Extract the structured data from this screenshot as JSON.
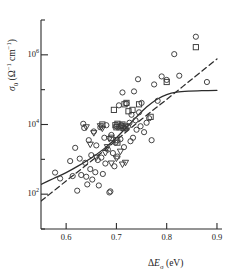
{
  "chart_data": {
    "type": "scatter",
    "title": "",
    "xlabel": "ΔEσ (eV)",
    "ylabel": "σ0 (Ω−1 cm−1)",
    "xlabel_parts": {
      "delta": "Δ",
      "e": "E",
      "sub": "σ",
      "unit": "(eV)"
    },
    "ylabel_parts": {
      "sigma": "σ",
      "sub": "0",
      "open": "(",
      "omega": "Ω",
      "exp1": "−1",
      "cm": "cm",
      "exp2": "−1",
      "close": ")"
    },
    "xlim": [
      0.55,
      0.91
    ],
    "ylim_log10": [
      1.0,
      7.0
    ],
    "xticks": [
      0.6,
      0.7,
      0.8,
      0.9
    ],
    "xticklabels": [
      "0.6",
      "0.7",
      "0.8",
      "0.9"
    ],
    "yticks_log10": [
      2,
      4,
      6
    ],
    "yticklabels": [
      "10²",
      "10⁴",
      "10⁶"
    ],
    "ytick_bases": [
      "10",
      "10",
      "10"
    ],
    "ytick_exps": [
      "2",
      "4",
      "6"
    ],
    "yminor_log10": [
      1,
      3,
      5,
      7
    ],
    "grid": false,
    "legend": "none",
    "axis_style": "left-and-bottom-spines",
    "series": [
      {
        "name": "circles",
        "marker": "circle",
        "points": [
          [
            0.578,
            2.62
          ],
          [
            0.588,
            2.45
          ],
          [
            0.608,
            2.95
          ],
          [
            0.613,
            2.52
          ],
          [
            0.618,
            3.33
          ],
          [
            0.622,
            2.1
          ],
          [
            0.627,
            3.02
          ],
          [
            0.63,
            2.55
          ],
          [
            0.634,
            4.02
          ],
          [
            0.636,
            3.9
          ],
          [
            0.638,
            2.9
          ],
          [
            0.64,
            2.5
          ],
          [
            0.642,
            2.28
          ],
          [
            0.645,
            3.55
          ],
          [
            0.648,
            2.72
          ],
          [
            0.65,
            3.12
          ],
          [
            0.652,
            2.42
          ],
          [
            0.655,
            3.8
          ],
          [
            0.658,
            2.63
          ],
          [
            0.66,
            3.4
          ],
          [
            0.663,
            2.98
          ],
          [
            0.665,
            2.25
          ],
          [
            0.668,
            3.92
          ],
          [
            0.67,
            3.05
          ],
          [
            0.673,
            2.58
          ],
          [
            0.676,
            3.62
          ],
          [
            0.678,
            2.88
          ],
          [
            0.68,
            3.98
          ],
          [
            0.683,
            3.28
          ],
          [
            0.686,
            2.05
          ],
          [
            0.688,
            2.08
          ],
          [
            0.69,
            3.7
          ],
          [
            0.693,
            3.18
          ],
          [
            0.696,
            2.8
          ],
          [
            0.698,
            3.48
          ],
          [
            0.7,
            3.95
          ],
          [
            0.702,
            3.08
          ],
          [
            0.705,
            4.55
          ],
          [
            0.708,
            3.58
          ],
          [
            0.71,
            3.98
          ],
          [
            0.712,
            4.92
          ],
          [
            0.715,
            3.35
          ],
          [
            0.718,
            3.88
          ],
          [
            0.72,
            4.6
          ],
          [
            0.723,
            3.95
          ],
          [
            0.726,
            4.05
          ],
          [
            0.728,
            3.52
          ],
          [
            0.73,
            4.28
          ],
          [
            0.733,
            3.62
          ],
          [
            0.735,
            4.95
          ],
          [
            0.738,
            4.12
          ],
          [
            0.74,
            3.85
          ],
          [
            0.743,
            5.3
          ],
          [
            0.745,
            4.35
          ],
          [
            0.748,
            3.95
          ],
          [
            0.75,
            4.62
          ],
          [
            0.755,
            3.78
          ],
          [
            0.76,
            4.05
          ],
          [
            0.765,
            4.18
          ],
          [
            0.77,
            3.55
          ],
          [
            0.775,
            5.15
          ],
          [
            0.782,
            4.68
          ],
          [
            0.79,
            5.38
          ],
          [
            0.8,
            5.28
          ],
          [
            0.815,
            6.02
          ],
          [
            0.825,
            5.4
          ],
          [
            0.858,
            6.52
          ],
          [
            0.88,
            5.22
          ]
        ]
      },
      {
        "name": "squares",
        "marker": "square",
        "points": [
          [
            0.698,
            3.98
          ],
          [
            0.7,
            3.92
          ],
          [
            0.702,
            4.02
          ],
          [
            0.7,
            3.55
          ],
          [
            0.702,
            3.48
          ],
          [
            0.706,
            3.92
          ],
          [
            0.71,
            3.96
          ],
          [
            0.712,
            4.0
          ],
          [
            0.714,
            3.9
          ],
          [
            0.718,
            3.94
          ],
          [
            0.695,
            4.42
          ],
          [
            0.716,
            4.58
          ],
          [
            0.72,
            4.62
          ],
          [
            0.724,
            4.38
          ],
          [
            0.732,
            4.42
          ],
          [
            0.745,
            4.58
          ],
          [
            0.768,
            4.22
          ],
          [
            0.8,
            5.22
          ],
          [
            0.858,
            6.22
          ],
          [
            0.672,
            4.0
          ],
          [
            0.69,
            3.62
          ]
        ]
      },
      {
        "name": "triangles",
        "marker": "triangle-down",
        "points": [
          [
            0.64,
            3.92
          ],
          [
            0.648,
            3.42
          ],
          [
            0.655,
            3.75
          ],
          [
            0.66,
            3.05
          ],
          [
            0.668,
            3.95
          ],
          [
            0.672,
            3.88
          ],
          [
            0.678,
            3.18
          ],
          [
            0.682,
            3.35
          ],
          [
            0.69,
            2.88
          ],
          [
            0.7,
            3.02
          ],
          [
            0.712,
            2.85
          ],
          [
            0.718,
            2.9
          ],
          [
            0.708,
            3.22
          ],
          [
            0.686,
            3.58
          ]
        ]
      }
    ],
    "curves": [
      {
        "name": "solid-fit",
        "style": "solid",
        "points": [
          [
            0.55,
            2.28
          ],
          [
            0.575,
            2.45
          ],
          [
            0.6,
            2.62
          ],
          [
            0.625,
            2.82
          ],
          [
            0.65,
            3.04
          ],
          [
            0.675,
            3.3
          ],
          [
            0.7,
            3.62
          ],
          [
            0.72,
            3.92
          ],
          [
            0.74,
            4.22
          ],
          [
            0.76,
            4.5
          ],
          [
            0.78,
            4.72
          ],
          [
            0.8,
            4.86
          ],
          [
            0.82,
            4.93
          ],
          [
            0.845,
            4.96
          ],
          [
            0.87,
            4.97
          ],
          [
            0.9,
            4.98
          ]
        ]
      },
      {
        "name": "dashed-fit",
        "style": "dashed",
        "points": [
          [
            0.55,
            1.8
          ],
          [
            0.6,
            2.38
          ],
          [
            0.65,
            2.95
          ],
          [
            0.7,
            3.55
          ],
          [
            0.75,
            4.15
          ],
          [
            0.8,
            4.72
          ],
          [
            0.85,
            5.3
          ],
          [
            0.9,
            5.88
          ]
        ]
      }
    ]
  }
}
